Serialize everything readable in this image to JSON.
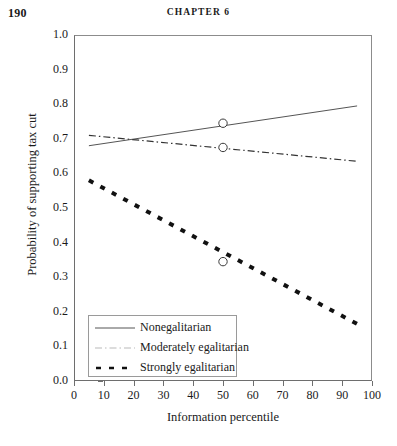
{
  "page": {
    "folio": "190",
    "running_head": "CHAPTER 6"
  },
  "chart_data": {
    "type": "line",
    "title": "",
    "xlabel": "Information percentile",
    "ylabel": "Probability of supporting tax cut",
    "xlim": [
      0,
      100
    ],
    "ylim": [
      0.0,
      1.0
    ],
    "grid": false,
    "legend_position": "lower-left-inside",
    "xticks": [
      "0",
      "10",
      "20",
      "30",
      "40",
      "50",
      "60",
      "70",
      "80",
      "90",
      "100"
    ],
    "yticks": [
      "0.0",
      "0.1",
      "0.2",
      "0.3",
      "0.4",
      "0.5",
      "0.6",
      "0.7",
      "0.8",
      "0.9",
      "1.0"
    ],
    "series": [
      {
        "name": "Nonegalitarian",
        "style": "solid",
        "color": "#555555",
        "width": 1,
        "x": [
          5,
          95
        ],
        "values": [
          0.68,
          0.795
        ],
        "markers": [
          {
            "x": 50,
            "y": 0.745
          }
        ]
      },
      {
        "name": "Moderately egalitarian",
        "style": "dash-dot",
        "color": "#333333",
        "width": 1.2,
        "x": [
          5,
          95
        ],
        "values": [
          0.71,
          0.635
        ],
        "markers": [
          {
            "x": 50,
            "y": 0.675
          }
        ]
      },
      {
        "name": "Strongly egalitarian",
        "style": "dashed",
        "color": "#111111",
        "width": 4,
        "x": [
          5,
          95
        ],
        "values": [
          0.58,
          0.165
        ],
        "markers": [
          {
            "x": 50,
            "y": 0.345
          }
        ]
      }
    ]
  }
}
